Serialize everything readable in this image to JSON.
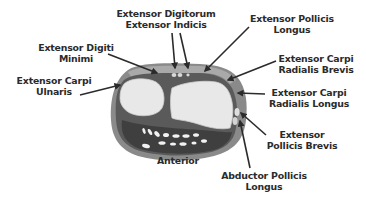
{
  "diagram": {
    "colors": {
      "background": "#ffffff",
      "outer_skin": "#8a8a8a",
      "outer_rim": "#a9a9a9",
      "muscle_dark": "#4a4a4a",
      "muscle_mid": "#6e6e6e",
      "bone": "#e8e8e8",
      "bone_edge": "#cfcfcf",
      "tendon": "#f2f2f2",
      "label_text": "#2b2b2b",
      "arrow": "#2b2b2b"
    },
    "labels": [
      {
        "id": "extensor-digitorum-indicis",
        "line1": "Extensor Digitorum",
        "line2": "Extensor Indicis",
        "x": 114,
        "y": 8,
        "w": 104
      },
      {
        "id": "extensor-pollicis-longus",
        "line1": "Extensor Pollicis",
        "line2": "Longus",
        "x": 244,
        "y": 13,
        "w": 96
      },
      {
        "id": "extensor-digiti-minimi",
        "line1": "Extensor Digiti",
        "line2": "Minimi",
        "x": 34,
        "y": 42,
        "w": 84
      },
      {
        "id": "extensor-carpi-radialis-brevis",
        "line1": "Extensor Carpi",
        "line2": "Radialis Brevis",
        "x": 270,
        "y": 53,
        "w": 92
      },
      {
        "id": "extensor-carpi-ulnaris",
        "line1": "Extensor Carpi",
        "line2": "Ulnaris",
        "x": 12,
        "y": 75,
        "w": 84
      },
      {
        "id": "extensor-carpi-radialis-longus",
        "line1": "Extensor Carpi",
        "line2": "Radialis Longus",
        "x": 260,
        "y": 87,
        "w": 98
      },
      {
        "id": "extensor-pollicis-brevis",
        "line1": "Extensor",
        "line2": "Pollicis Brevis",
        "x": 260,
        "y": 129,
        "w": 84
      },
      {
        "id": "anterior",
        "line1": "Anterior",
        "line2": "",
        "x": 148,
        "y": 155,
        "w": 60
      },
      {
        "id": "abductor-pollicis-longus",
        "line1": "Abductor Pollicis",
        "line2": "Longus",
        "x": 214,
        "y": 170,
        "w": 100
      }
    ],
    "arrows": [
      {
        "id": "arrow-extensor-digitorum",
        "x1": 172,
        "y1": 33,
        "x2": 175,
        "y2": 68
      },
      {
        "id": "arrow-extensor-indicis",
        "x1": 180,
        "y1": 33,
        "x2": 188,
        "y2": 68
      },
      {
        "id": "arrow-extensor-pollicis-longus",
        "x1": 249,
        "y1": 27,
        "x2": 205,
        "y2": 71
      },
      {
        "id": "arrow-extensor-digiti-minimi",
        "x1": 108,
        "y1": 54,
        "x2": 157,
        "y2": 73
      },
      {
        "id": "arrow-extensor-carpi-ulnaris",
        "x1": 80,
        "y1": 95,
        "x2": 120,
        "y2": 85
      },
      {
        "id": "arrow-extensor-carpi-radialis-brevis",
        "x1": 276,
        "y1": 61,
        "x2": 228,
        "y2": 80
      },
      {
        "id": "arrow-extensor-carpi-radialis-longus",
        "x1": 265,
        "y1": 94,
        "x2": 238,
        "y2": 93
      },
      {
        "id": "arrow-extensor-pollicis-brevis",
        "x1": 266,
        "y1": 135,
        "x2": 241,
        "y2": 113
      },
      {
        "id": "arrow-abductor-pollicis-longus",
        "x1": 250,
        "y1": 168,
        "x2": 240,
        "y2": 121
      }
    ]
  }
}
